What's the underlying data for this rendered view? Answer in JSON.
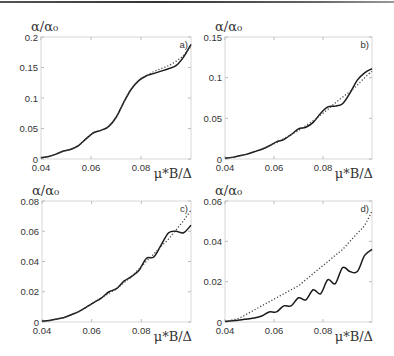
{
  "chart_data": [
    {
      "type": "line",
      "panel_label": "a)",
      "ylabel": "α/α₀",
      "xlabel": "μ*B/Δ",
      "xlim": [
        0.04,
        0.1
      ],
      "ylim": [
        0,
        0.2
      ],
      "xticks": [
        "0.04",
        "0.06",
        "0.08"
      ],
      "yticks": [
        "0",
        "0.05",
        "0.1",
        "0.15",
        "0.2"
      ],
      "grid": false,
      "legend": "none",
      "series": [
        {
          "name": "solid",
          "style": "solid",
          "x": [
            0.04,
            0.043,
            0.046,
            0.049,
            0.052,
            0.055,
            0.058,
            0.061,
            0.064,
            0.067,
            0.07,
            0.073,
            0.076,
            0.079,
            0.082,
            0.085,
            0.088,
            0.091,
            0.094,
            0.097,
            0.1
          ],
          "y": [
            0.002,
            0.004,
            0.008,
            0.013,
            0.016,
            0.022,
            0.033,
            0.043,
            0.047,
            0.053,
            0.068,
            0.092,
            0.114,
            0.128,
            0.136,
            0.14,
            0.144,
            0.148,
            0.153,
            0.167,
            0.188
          ]
        },
        {
          "name": "dotted",
          "style": "dotted",
          "x": [
            0.04,
            0.043,
            0.046,
            0.049,
            0.052,
            0.055,
            0.058,
            0.061,
            0.064,
            0.067,
            0.07,
            0.073,
            0.076,
            0.079,
            0.082,
            0.085,
            0.088,
            0.091,
            0.094,
            0.097,
            0.1
          ],
          "y": [
            0.002,
            0.004,
            0.008,
            0.013,
            0.016,
            0.022,
            0.033,
            0.043,
            0.047,
            0.053,
            0.068,
            0.092,
            0.114,
            0.128,
            0.136,
            0.143,
            0.148,
            0.153,
            0.16,
            0.17,
            0.185
          ]
        }
      ]
    },
    {
      "type": "line",
      "panel_label": "b)",
      "ylabel": "α/α₀",
      "xlabel": "μ*B/Δ",
      "xlim": [
        0.04,
        0.1
      ],
      "ylim": [
        0,
        0.15
      ],
      "xticks": [
        "0.04",
        "0.06",
        "0.08"
      ],
      "yticks": [
        "0",
        "0.05",
        "0.1",
        "0.15"
      ],
      "grid": false,
      "legend": "none",
      "series": [
        {
          "name": "solid",
          "style": "solid",
          "x": [
            0.04,
            0.043,
            0.046,
            0.049,
            0.052,
            0.055,
            0.058,
            0.061,
            0.064,
            0.067,
            0.07,
            0.073,
            0.076,
            0.079,
            0.082,
            0.085,
            0.088,
            0.091,
            0.094,
            0.097,
            0.1
          ],
          "y": [
            0.001,
            0.002,
            0.004,
            0.006,
            0.009,
            0.012,
            0.016,
            0.021,
            0.024,
            0.03,
            0.037,
            0.039,
            0.045,
            0.056,
            0.064,
            0.065,
            0.068,
            0.081,
            0.097,
            0.106,
            0.111
          ]
        },
        {
          "name": "dotted",
          "style": "dotted",
          "x": [
            0.04,
            0.043,
            0.046,
            0.049,
            0.052,
            0.055,
            0.058,
            0.061,
            0.064,
            0.067,
            0.07,
            0.073,
            0.076,
            0.079,
            0.082,
            0.085,
            0.088,
            0.091,
            0.094,
            0.097,
            0.1
          ],
          "y": [
            0.001,
            0.002,
            0.004,
            0.006,
            0.009,
            0.012,
            0.016,
            0.02,
            0.025,
            0.03,
            0.035,
            0.041,
            0.047,
            0.054,
            0.061,
            0.069,
            0.076,
            0.083,
            0.091,
            0.1,
            0.108
          ]
        }
      ]
    },
    {
      "type": "line",
      "panel_label": "c)",
      "ylabel": "α/α₀",
      "xlabel": "μ*B/Δ",
      "xlim": [
        0.04,
        0.1
      ],
      "ylim": [
        0,
        0.08
      ],
      "xticks": [
        "0.04",
        "0.06",
        "0.08"
      ],
      "yticks": [
        "0",
        "0.02",
        "0.04",
        "0.06",
        "0.08"
      ],
      "grid": false,
      "legend": "none",
      "series": [
        {
          "name": "solid",
          "style": "solid",
          "x": [
            0.04,
            0.043,
            0.046,
            0.049,
            0.052,
            0.055,
            0.058,
            0.061,
            0.064,
            0.067,
            0.07,
            0.073,
            0.076,
            0.079,
            0.082,
            0.085,
            0.088,
            0.091,
            0.094,
            0.097,
            0.1
          ],
          "y": [
            0.0005,
            0.001,
            0.002,
            0.003,
            0.005,
            0.007,
            0.01,
            0.013,
            0.016,
            0.02,
            0.022,
            0.027,
            0.03,
            0.034,
            0.042,
            0.043,
            0.051,
            0.059,
            0.06,
            0.059,
            0.064
          ]
        },
        {
          "name": "dotted",
          "style": "dotted",
          "x": [
            0.04,
            0.043,
            0.046,
            0.049,
            0.052,
            0.055,
            0.058,
            0.061,
            0.064,
            0.067,
            0.07,
            0.073,
            0.076,
            0.079,
            0.082,
            0.085,
            0.088,
            0.091,
            0.094,
            0.097,
            0.1
          ],
          "y": [
            0.0005,
            0.001,
            0.002,
            0.003,
            0.005,
            0.007,
            0.01,
            0.013,
            0.016,
            0.019,
            0.022,
            0.026,
            0.03,
            0.035,
            0.04,
            0.045,
            0.05,
            0.055,
            0.061,
            0.067,
            0.074
          ]
        }
      ]
    },
    {
      "type": "line",
      "panel_label": "d)",
      "ylabel": "α/α₀",
      "xlabel": "μ*B/Δ",
      "xlim": [
        0.04,
        0.1
      ],
      "ylim": [
        0,
        0.06
      ],
      "xticks": [
        "0.04",
        "0.06",
        "0.08"
      ],
      "yticks": [
        "0",
        "0.02",
        "0.04",
        "0.06"
      ],
      "grid": false,
      "legend": "none",
      "series": [
        {
          "name": "solid",
          "style": "solid",
          "x": [
            0.04,
            0.043,
            0.046,
            0.049,
            0.052,
            0.055,
            0.058,
            0.061,
            0.064,
            0.067,
            0.07,
            0.073,
            0.076,
            0.079,
            0.082,
            0.085,
            0.088,
            0.091,
            0.094,
            0.097,
            0.1
          ],
          "y": [
            0.0003,
            0.0006,
            0.001,
            0.0015,
            0.002,
            0.003,
            0.005,
            0.005,
            0.008,
            0.008,
            0.012,
            0.011,
            0.016,
            0.014,
            0.021,
            0.019,
            0.027,
            0.025,
            0.025,
            0.033,
            0.036
          ]
        },
        {
          "name": "dotted",
          "style": "dotted",
          "x": [
            0.04,
            0.043,
            0.046,
            0.049,
            0.052,
            0.055,
            0.058,
            0.061,
            0.064,
            0.067,
            0.07,
            0.073,
            0.076,
            0.079,
            0.082,
            0.085,
            0.088,
            0.091,
            0.094,
            0.097,
            0.1
          ],
          "y": [
            0.0003,
            0.001,
            0.002,
            0.004,
            0.006,
            0.008,
            0.01,
            0.012,
            0.014,
            0.016,
            0.018,
            0.021,
            0.024,
            0.027,
            0.03,
            0.033,
            0.036,
            0.04,
            0.044,
            0.048,
            0.055
          ]
        }
      ]
    }
  ]
}
